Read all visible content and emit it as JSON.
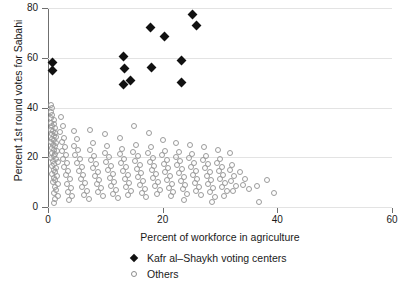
{
  "chart_data": {
    "type": "scatter",
    "title": "",
    "xlabel": "Percent of workforce in agriculture",
    "ylabel": "Percent 1st round votes for Sabahi",
    "xlim": [
      0,
      60
    ],
    "ylim": [
      0,
      80
    ],
    "xticks": [
      0,
      20,
      40,
      60
    ],
    "yticks": [
      0,
      20,
      40,
      60,
      80
    ],
    "grid": "horizontal",
    "legend_position": "bottom-center",
    "series": [
      {
        "name": "Kafr al–Shaykh voting centers",
        "marker": "filled-diamond",
        "color": "#111111",
        "points": [
          [
            0.7,
            58.2
          ],
          [
            0.7,
            55.0
          ],
          [
            13.2,
            60.4
          ],
          [
            13.4,
            55.6
          ],
          [
            13.2,
            49.3
          ],
          [
            14.4,
            51.0
          ],
          [
            17.9,
            72.1
          ],
          [
            18.0,
            55.9
          ],
          [
            20.4,
            68.6
          ],
          [
            23.2,
            59.0
          ],
          [
            23.3,
            50.0
          ],
          [
            25.2,
            77.5
          ],
          [
            25.9,
            73.0
          ]
        ]
      },
      {
        "name": "Others",
        "marker": "open-circle",
        "color": "#9b9b9b",
        "points": [
          [
            0.3,
            41.5
          ],
          [
            0.5,
            40.2
          ],
          [
            0.4,
            38.6
          ],
          [
            0.6,
            37.3
          ],
          [
            0.3,
            36.1
          ],
          [
            0.8,
            35.4
          ],
          [
            0.4,
            34.2
          ],
          [
            0.9,
            33.6
          ],
          [
            0.5,
            32.8
          ],
          [
            1.1,
            32.1
          ],
          [
            0.4,
            31.4
          ],
          [
            0.7,
            30.9
          ],
          [
            1.0,
            30.2
          ],
          [
            0.5,
            29.6
          ],
          [
            0.8,
            29.0
          ],
          [
            1.2,
            28.4
          ],
          [
            0.6,
            27.9
          ],
          [
            0.9,
            27.2
          ],
          [
            0.4,
            26.6
          ],
          [
            1.3,
            26.0
          ],
          [
            0.7,
            25.4
          ],
          [
            1.0,
            24.8
          ],
          [
            0.5,
            24.1
          ],
          [
            0.8,
            23.5
          ],
          [
            1.4,
            22.9
          ],
          [
            0.6,
            22.2
          ],
          [
            1.1,
            21.6
          ],
          [
            0.9,
            21.0
          ],
          [
            0.4,
            20.3
          ],
          [
            1.2,
            19.7
          ],
          [
            0.7,
            19.0
          ],
          [
            1.5,
            18.4
          ],
          [
            0.9,
            17.6
          ],
          [
            0.5,
            16.9
          ],
          [
            1.3,
            16.1
          ],
          [
            0.8,
            15.4
          ],
          [
            1.0,
            14.6
          ],
          [
            0.6,
            13.8
          ],
          [
            1.4,
            13.0
          ],
          [
            0.9,
            12.1
          ],
          [
            1.1,
            11.3
          ],
          [
            0.7,
            10.4
          ],
          [
            1.6,
            9.6
          ],
          [
            1.0,
            8.5
          ],
          [
            1.3,
            7.4
          ],
          [
            0.8,
            6.2
          ],
          [
            1.5,
            5.0
          ],
          [
            1.1,
            3.6
          ],
          [
            0.9,
            2.2
          ],
          [
            2.1,
            36.4
          ],
          [
            2.4,
            33.1
          ],
          [
            2.0,
            30.4
          ],
          [
            2.6,
            28.2
          ],
          [
            2.2,
            26.4
          ],
          [
            2.8,
            24.6
          ],
          [
            2.3,
            22.8
          ],
          [
            3.0,
            21.2
          ],
          [
            2.5,
            19.6
          ],
          [
            3.2,
            18.0
          ],
          [
            2.7,
            16.4
          ],
          [
            3.4,
            14.8
          ],
          [
            2.9,
            13.2
          ],
          [
            3.6,
            11.6
          ],
          [
            3.1,
            9.8
          ],
          [
            3.8,
            8.2
          ],
          [
            3.3,
            6.4
          ],
          [
            4.0,
            4.8
          ],
          [
            3.5,
            3.2
          ],
          [
            4.4,
            31.0
          ],
          [
            4.8,
            27.6
          ],
          [
            4.3,
            25.0
          ],
          [
            5.1,
            23.2
          ],
          [
            4.6,
            21.4
          ],
          [
            5.4,
            19.8
          ],
          [
            4.9,
            18.2
          ],
          [
            5.7,
            16.6
          ],
          [
            5.2,
            15.0
          ],
          [
            6.0,
            13.4
          ],
          [
            5.5,
            11.8
          ],
          [
            6.3,
            10.2
          ],
          [
            5.8,
            8.6
          ],
          [
            6.6,
            7.0
          ],
          [
            6.1,
            5.4
          ],
          [
            6.9,
            3.8
          ],
          [
            7.2,
            31.2
          ],
          [
            7.6,
            26.0
          ],
          [
            7.1,
            23.4
          ],
          [
            7.9,
            21.0
          ],
          [
            7.4,
            19.2
          ],
          [
            8.2,
            17.6
          ],
          [
            7.7,
            16.0
          ],
          [
            8.5,
            14.4
          ],
          [
            8.0,
            12.8
          ],
          [
            8.8,
            11.2
          ],
          [
            8.3,
            9.6
          ],
          [
            9.1,
            8.0
          ],
          [
            8.6,
            6.4
          ],
          [
            9.4,
            4.8
          ],
          [
            9.8,
            29.8
          ],
          [
            10.2,
            24.8
          ],
          [
            9.7,
            22.2
          ],
          [
            10.5,
            20.4
          ],
          [
            10.0,
            18.6
          ],
          [
            10.8,
            17.0
          ],
          [
            10.3,
            15.4
          ],
          [
            11.1,
            13.8
          ],
          [
            10.6,
            12.2
          ],
          [
            11.4,
            10.6
          ],
          [
            10.9,
            9.0
          ],
          [
            11.7,
            7.4
          ],
          [
            11.2,
            5.8
          ],
          [
            12.0,
            4.2
          ],
          [
            12.4,
            28.2
          ],
          [
            12.8,
            23.8
          ],
          [
            12.3,
            21.6
          ],
          [
            13.1,
            19.8
          ],
          [
            12.6,
            18.0
          ],
          [
            13.4,
            16.4
          ],
          [
            12.9,
            14.8
          ],
          [
            13.7,
            13.2
          ],
          [
            13.2,
            11.6
          ],
          [
            14.0,
            10.0
          ],
          [
            13.5,
            8.4
          ],
          [
            14.3,
            6.8
          ],
          [
            13.8,
            5.2
          ],
          [
            14.8,
            33.0
          ],
          [
            15.2,
            25.2
          ],
          [
            14.7,
            22.6
          ],
          [
            15.5,
            20.8
          ],
          [
            15.0,
            19.0
          ],
          [
            15.8,
            17.4
          ],
          [
            15.3,
            15.8
          ],
          [
            16.1,
            14.2
          ],
          [
            15.6,
            12.6
          ],
          [
            16.4,
            11.0
          ],
          [
            15.9,
            9.4
          ],
          [
            16.7,
            7.8
          ],
          [
            16.2,
            6.2
          ],
          [
            17.0,
            4.6
          ],
          [
            17.4,
            30.2
          ],
          [
            17.8,
            24.4
          ],
          [
            17.3,
            22.0
          ],
          [
            18.1,
            20.2
          ],
          [
            17.6,
            18.4
          ],
          [
            18.4,
            16.8
          ],
          [
            17.9,
            15.2
          ],
          [
            18.7,
            13.6
          ],
          [
            18.2,
            12.0
          ],
          [
            19.0,
            10.4
          ],
          [
            18.5,
            8.8
          ],
          [
            19.3,
            7.2
          ],
          [
            18.8,
            5.6
          ],
          [
            19.8,
            27.4
          ],
          [
            20.2,
            23.0
          ],
          [
            19.7,
            21.2
          ],
          [
            20.5,
            19.4
          ],
          [
            20.0,
            17.8
          ],
          [
            20.8,
            16.2
          ],
          [
            20.3,
            14.6
          ],
          [
            21.1,
            13.0
          ],
          [
            20.6,
            11.4
          ],
          [
            21.4,
            9.8
          ],
          [
            20.9,
            8.2
          ],
          [
            21.7,
            6.6
          ],
          [
            21.2,
            4.8
          ],
          [
            22.2,
            26.0
          ],
          [
            22.6,
            22.4
          ],
          [
            22.1,
            20.6
          ],
          [
            22.9,
            18.8
          ],
          [
            22.4,
            17.2
          ],
          [
            23.2,
            15.6
          ],
          [
            22.7,
            14.0
          ],
          [
            23.5,
            12.4
          ],
          [
            23.0,
            10.8
          ],
          [
            23.8,
            9.2
          ],
          [
            23.3,
            7.6
          ],
          [
            24.1,
            5.8
          ],
          [
            23.6,
            3.4
          ],
          [
            24.6,
            25.4
          ],
          [
            25.0,
            21.8
          ],
          [
            24.5,
            20.0
          ],
          [
            25.3,
            18.2
          ],
          [
            24.8,
            16.6
          ],
          [
            25.6,
            15.0
          ],
          [
            25.1,
            13.4
          ],
          [
            25.9,
            11.8
          ],
          [
            25.4,
            10.2
          ],
          [
            26.2,
            8.6
          ],
          [
            25.7,
            7.0
          ],
          [
            26.5,
            5.2
          ],
          [
            27.0,
            24.6
          ],
          [
            27.4,
            21.0
          ],
          [
            26.9,
            19.2
          ],
          [
            27.7,
            17.6
          ],
          [
            27.2,
            16.0
          ],
          [
            28.0,
            14.4
          ],
          [
            27.5,
            12.8
          ],
          [
            28.3,
            11.2
          ],
          [
            27.8,
            9.6
          ],
          [
            28.6,
            8.0
          ],
          [
            28.1,
            6.4
          ],
          [
            28.9,
            4.6
          ],
          [
            28.4,
            2.6
          ],
          [
            29.4,
            23.4
          ],
          [
            29.8,
            19.8
          ],
          [
            29.3,
            18.0
          ],
          [
            30.1,
            16.4
          ],
          [
            29.6,
            14.8
          ],
          [
            30.4,
            13.2
          ],
          [
            29.9,
            11.6
          ],
          [
            30.7,
            10.0
          ],
          [
            30.2,
            8.4
          ],
          [
            31.0,
            6.8
          ],
          [
            30.5,
            5.0
          ],
          [
            31.6,
            22.0
          ],
          [
            32.0,
            17.2
          ],
          [
            31.5,
            15.2
          ],
          [
            32.3,
            13.0
          ],
          [
            31.8,
            11.0
          ],
          [
            32.6,
            9.0
          ],
          [
            32.1,
            7.0
          ],
          [
            33.4,
            14.6
          ],
          [
            34.2,
            11.8
          ],
          [
            33.8,
            9.2
          ],
          [
            34.8,
            7.6
          ],
          [
            36.2,
            8.8
          ],
          [
            36.6,
            2.4
          ],
          [
            38.0,
            11.4
          ],
          [
            39.2,
            6.2
          ]
        ]
      }
    ]
  },
  "legend": {
    "entries": [
      {
        "label": "Kafr al–Shaykh voting centers",
        "symbol": "filled-diamond"
      },
      {
        "label": "Others",
        "symbol": "open-circle"
      }
    ]
  },
  "axes": {
    "x_tick_labels": [
      "0",
      "20",
      "40",
      "60"
    ],
    "y_tick_labels": [
      "0",
      "20",
      "40",
      "60",
      "80"
    ],
    "x_title": "Percent of workforce in agriculture",
    "y_title": "Percent 1st round votes for Sabahi"
  },
  "colors": {
    "kafr_marker": "#111111",
    "other_marker": "#9b9b9b",
    "gridline": "#e3e3e3",
    "axis": "#6f6f6f",
    "background": "#ffffff"
  }
}
